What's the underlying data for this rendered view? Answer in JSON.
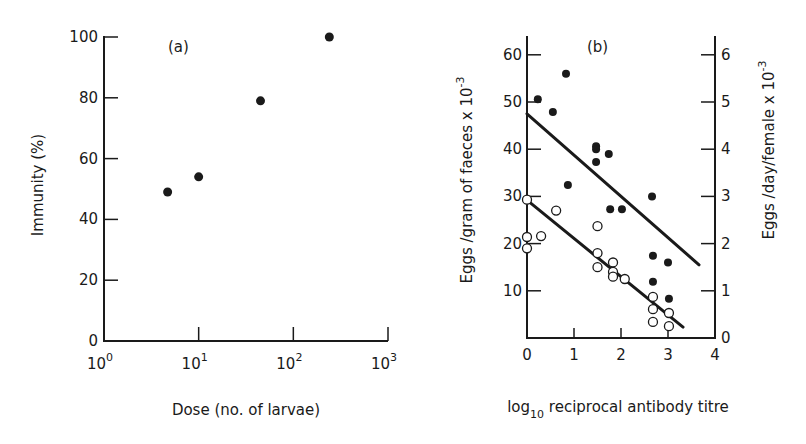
{
  "chart_data": [
    {
      "panel": "(a)",
      "type": "scatter",
      "title": "",
      "xlabel": "Dose (no. of larvae)",
      "ylabel": "Immunity (%)",
      "xscale": "log",
      "xlim": [
        1,
        1000
      ],
      "ylim": [
        0,
        100
      ],
      "xticks": [
        {
          "value": 1,
          "base": "10",
          "exp": "0"
        },
        {
          "value": 10,
          "base": "10",
          "exp": "1"
        },
        {
          "value": 100,
          "base": "10",
          "exp": "2"
        },
        {
          "value": 1000,
          "base": "10",
          "exp": "3"
        }
      ],
      "yticks": [
        0,
        20,
        40,
        60,
        80,
        100
      ],
      "grid": false,
      "series": [
        {
          "name": "Immunity",
          "marker": "filled-circle",
          "points": [
            {
              "x": 4.7,
              "y": 49
            },
            {
              "x": 10,
              "y": 54
            },
            {
              "x": 45,
              "y": 79
            },
            {
              "x": 240,
              "y": 100
            }
          ]
        }
      ]
    },
    {
      "panel": "(b)",
      "type": "scatter",
      "title": "",
      "xlabel": "log10 reciprocal antibody titre",
      "xlabel_parts": {
        "pre": "log",
        "sub": "10",
        "post": " reciprocal antibody titre"
      },
      "ylabel": "Eggs /gram of faeces x 10^-3",
      "ylabel_parts": {
        "text": "Eggs /gram of faeces x 10",
        "sup": "-3"
      },
      "ylabel_right": "Eggs /day/female x 10^-3",
      "ylabel_right_parts": {
        "text": "Eggs /day/female x 10",
        "sup": "-3"
      },
      "xlim": [
        0,
        4
      ],
      "ylim": [
        0,
        64
      ],
      "ylim_right": [
        0,
        6.4
      ],
      "xticks": [
        0,
        1,
        2,
        3,
        4
      ],
      "yticks": [
        10,
        20,
        30,
        40,
        50,
        60
      ],
      "yticks_right": [
        0,
        1,
        2,
        3,
        4,
        5,
        6
      ],
      "grid": false,
      "series": [
        {
          "name": "Eggs/day/female (filled)",
          "marker": "filled-circle",
          "axis": "right",
          "points": [
            {
              "x": 0.23,
              "y": 5.06
            },
            {
              "x": 0.55,
              "y": 4.79
            },
            {
              "x": 0.83,
              "y": 5.6
            },
            {
              "x": 0.87,
              "y": 3.24
            },
            {
              "x": 1.47,
              "y": 4.06
            },
            {
              "x": 1.47,
              "y": 4.0
            },
            {
              "x": 1.47,
              "y": 3.73
            },
            {
              "x": 1.74,
              "y": 3.9
            },
            {
              "x": 1.77,
              "y": 2.73
            },
            {
              "x": 2.02,
              "y": 2.73
            },
            {
              "x": 2.66,
              "y": 3.0
            },
            {
              "x": 2.68,
              "y": 1.74
            },
            {
              "x": 3.0,
              "y": 1.6
            },
            {
              "x": 2.68,
              "y": 1.19
            },
            {
              "x": 3.02,
              "y": 0.83
            }
          ],
          "fit_line": {
            "x0": 0.0,
            "y0": 4.75,
            "x1": 3.66,
            "y1": 1.55
          }
        },
        {
          "name": "Eggs/gram of faeces (open)",
          "marker": "open-circle",
          "axis": "left",
          "points": [
            {
              "x": 0.0,
              "y": 29.3
            },
            {
              "x": 0.0,
              "y": 21.4
            },
            {
              "x": 0.0,
              "y": 19.0
            },
            {
              "x": 0.3,
              "y": 21.6
            },
            {
              "x": 0.62,
              "y": 27.0
            },
            {
              "x": 1.5,
              "y": 23.7
            },
            {
              "x": 1.5,
              "y": 18.0
            },
            {
              "x": 1.5,
              "y": 15.0
            },
            {
              "x": 1.83,
              "y": 16.0
            },
            {
              "x": 1.83,
              "y": 14.0
            },
            {
              "x": 1.83,
              "y": 13.0
            },
            {
              "x": 2.08,
              "y": 12.5
            },
            {
              "x": 2.68,
              "y": 8.7
            },
            {
              "x": 2.68,
              "y": 6.1
            },
            {
              "x": 2.68,
              "y": 3.4
            },
            {
              "x": 3.02,
              "y": 5.3
            },
            {
              "x": 3.02,
              "y": 2.5
            }
          ],
          "fit_line": {
            "x0": 0.0,
            "y0": 29.2,
            "x1": 3.32,
            "y1": 2.3
          }
        }
      ]
    }
  ]
}
